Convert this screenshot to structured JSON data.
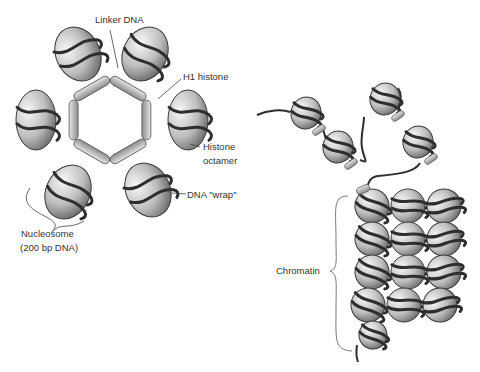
{
  "figure": {
    "left_panel": {
      "title": "Nucleosome ring with H1 histone",
      "labels": {
        "linker_dna": "Linker DNA",
        "h1_histone": "H1 histone",
        "histone_octamer_line1": "Histone",
        "histone_octamer_line2": "octamer",
        "dna_wrap": "DNA \"wrap\"",
        "nucleosome_line1": "Nucleosome",
        "nucleosome_line2": "(200 bp DNA)"
      },
      "nucleosome_count": 6
    },
    "right_panel": {
      "title": "Chromatin fiber",
      "labels": {
        "chromatin": "Chromatin"
      },
      "free_nucleosome_count": 4,
      "packed_grid": {
        "rows": 4,
        "cols": 3,
        "tail_count": 1
      }
    },
    "colors": {
      "histone_light": "#f2f2f2",
      "histone_dark": "#6a6a6a",
      "dna": "#2e2e2e",
      "h1_light": "#d9d9d9",
      "h1_dark": "#8a8a8a",
      "label_text": "#333333",
      "leader_line": "#444444"
    }
  }
}
